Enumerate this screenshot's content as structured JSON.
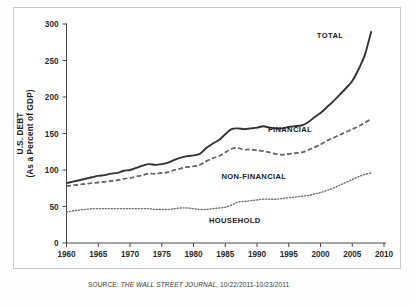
{
  "figure": {
    "clipped_header": "",
    "source_prefix": "SOURCE:",
    "source_publication": "THE WALL STREET JOURNAL,",
    "source_dates": "10/22/2011-10/23/2011"
  },
  "axes": {
    "ylabel_line1": "U.S. DEBT",
    "ylabel_line2": "(As a Percent of GDP)",
    "xlabel": "",
    "yticks": [
      0,
      50,
      100,
      150,
      200,
      250,
      300
    ],
    "xticks": [
      1960,
      1965,
      1970,
      1975,
      1980,
      1985,
      1990,
      1995,
      2000,
      2005,
      2010
    ],
    "ylim": [
      0,
      300
    ],
    "xlim": [
      1960,
      2010
    ],
    "grid": false
  },
  "chart_data": {
    "type": "line",
    "title": "",
    "subtitle": "",
    "xlabel": "",
    "ylabel": "U.S. DEBT (As a Percent of GDP)",
    "xlim": [
      1960,
      2010
    ],
    "ylim": [
      0,
      300
    ],
    "grid": false,
    "legend_position": "inline-annotations",
    "x": [
      1960,
      1961,
      1962,
      1963,
      1964,
      1965,
      1966,
      1967,
      1968,
      1969,
      1970,
      1971,
      1972,
      1973,
      1974,
      1975,
      1976,
      1977,
      1978,
      1979,
      1980,
      1981,
      1982,
      1983,
      1984,
      1985,
      1986,
      1987,
      1988,
      1989,
      1990,
      1991,
      1992,
      1993,
      1994,
      1995,
      1996,
      1997,
      1998,
      1999,
      2000,
      2001,
      2002,
      2003,
      2004,
      2005,
      2006,
      2007,
      2008
    ],
    "series": [
      {
        "name": "TOTAL",
        "style": "solid",
        "color": "#333333",
        "label_x": 2001.5,
        "label_y": 281,
        "values": [
          82,
          84,
          86,
          88,
          90,
          92,
          93,
          95,
          96,
          99,
          100,
          103,
          106,
          108,
          107,
          108,
          110,
          114,
          117,
          119,
          120,
          122,
          130,
          136,
          141,
          149,
          156,
          157,
          156,
          157,
          158,
          160,
          158,
          157,
          157,
          159,
          160,
          161,
          165,
          172,
          178,
          186,
          194,
          203,
          212,
          222,
          238,
          258,
          290
        ]
      },
      {
        "name": "FINANCIAL",
        "style": "dashed",
        "color": "#5a5a5a",
        "label_x": 1995.2,
        "label_y": 152,
        "values": [
          78,
          79,
          80,
          81,
          82,
          83,
          84,
          85,
          86,
          88,
          89,
          91,
          93,
          95,
          95,
          96,
          97,
          100,
          102,
          104,
          105,
          107,
          112,
          116,
          119,
          124,
          129,
          130,
          128,
          128,
          127,
          126,
          124,
          122,
          121,
          122,
          123,
          124,
          127,
          131,
          135,
          140,
          144,
          148,
          152,
          156,
          160,
          165,
          170
        ]
      },
      {
        "name": "NON-FINANCIAL",
        "style": "dashed-long",
        "color": "#6a6a6a",
        "label_x": 1989.5,
        "label_y": 88,
        "values": [
          78,
          79,
          80,
          81,
          82,
          83,
          84,
          85,
          86,
          88,
          89,
          91,
          93,
          95,
          95,
          96,
          97,
          100,
          102,
          104,
          105,
          107,
          112,
          116,
          119,
          124,
          129,
          130,
          128,
          128,
          127,
          126,
          124,
          122,
          121,
          122,
          123,
          124,
          127,
          131,
          135,
          140,
          144,
          148,
          152,
          156,
          160,
          165,
          170
        ]
      },
      {
        "name": "HOUSEHOLD",
        "style": "dotted",
        "color": "#6a6a6a",
        "label_x": 1986.5,
        "label_y": 27,
        "values": [
          42,
          44,
          45,
          46,
          47,
          47,
          47,
          47,
          47,
          47,
          47,
          47,
          47,
          47,
          46,
          46,
          46,
          47,
          48,
          48,
          47,
          46,
          46,
          47,
          48,
          49,
          52,
          56,
          57,
          58,
          59,
          60,
          60,
          60,
          61,
          62,
          63,
          64,
          65,
          67,
          69,
          72,
          75,
          79,
          83,
          87,
          91,
          94,
          96
        ]
      }
    ],
    "annotations": [
      {
        "text": "TOTAL",
        "x": 2001.5,
        "y": 281
      },
      {
        "text": "FINANCIAL",
        "x": 1995.2,
        "y": 152
      },
      {
        "text": "NON-FINANCIAL",
        "x": 1989.5,
        "y": 88
      },
      {
        "text": "HOUSEHOLD",
        "x": 1986.5,
        "y": 27
      }
    ]
  }
}
